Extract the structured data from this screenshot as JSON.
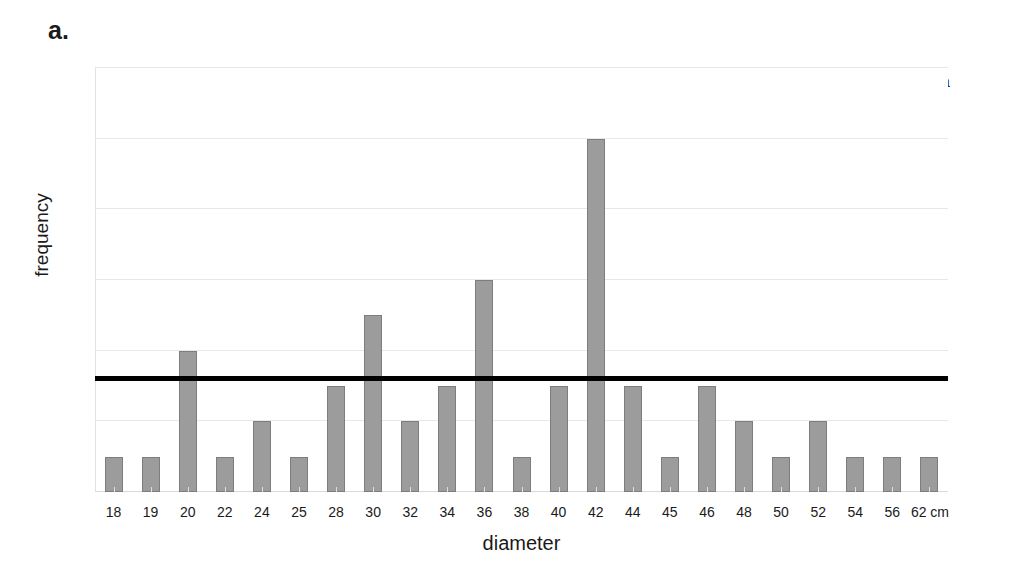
{
  "panel": {
    "label": "a."
  },
  "annotation": {
    "text": "SM 2a"
  },
  "chart_data": {
    "type": "bar",
    "title": "",
    "subtitle": "",
    "xlabel": "diameter",
    "ylabel": "frequency",
    "categories": [
      "18",
      "19",
      "20",
      "22",
      "24",
      "25",
      "28",
      "30",
      "32",
      "34",
      "36",
      "38",
      "40",
      "42",
      "44",
      "45",
      "46",
      "48",
      "50",
      "52",
      "54",
      "56",
      "62 cm"
    ],
    "values": [
      1,
      1,
      4,
      1,
      2,
      1,
      3,
      5,
      2,
      3,
      6,
      1,
      3,
      10,
      3,
      1,
      3,
      2,
      1,
      2,
      1,
      1,
      1
    ],
    "ylim": [
      0,
      12
    ],
    "yticks": [
      0,
      2,
      4,
      6,
      8,
      10,
      12
    ],
    "ytick_labels": [
      "0",
      "2",
      "4",
      "6",
      "8",
      "10",
      "12"
    ],
    "grid": true,
    "legend": null,
    "legend_position": "none",
    "bar_color": "#9c9c9c",
    "bar_edge_color": "#7d7d7d",
    "annotations": [
      {
        "kind": "horizontal-reference-line",
        "value": 3.2,
        "color": "#000000",
        "label": ""
      }
    ],
    "units": "cm"
  }
}
